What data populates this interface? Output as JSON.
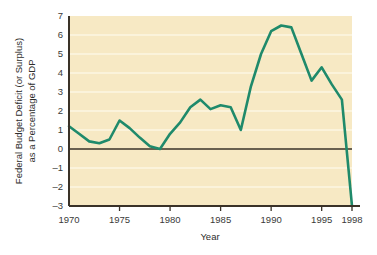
{
  "chart_data": {
    "type": "line",
    "title": "",
    "xlabel": "Year",
    "ylabel": "Federal Budget Deficit (or Surplus) as a Percentage of GDP",
    "ylabel_line1": "Federal Budget Deficit (or Surplus)",
    "ylabel_line2": "as a Percentage of GDP",
    "xlim": [
      1970,
      1998
    ],
    "ylim": [
      -3,
      7
    ],
    "grid": "horizontal",
    "legend": "none",
    "line_color": "#1f8a6b",
    "plot_background": "#f7e9c4",
    "gridline_color": "#fdf6e3",
    "axis_color": "#3a3228",
    "zero_line_color": "#3a3228",
    "xticks": [
      1970,
      1975,
      1980,
      1985,
      1990,
      1995,
      1998
    ],
    "xtick_labels": [
      "1970",
      "1975",
      "1980",
      "1985",
      "1990",
      "1995",
      "1998"
    ],
    "yticks": [
      7,
      6,
      5,
      4,
      3,
      2,
      1,
      0,
      -1,
      -2,
      -3
    ],
    "ytick_labels": [
      "7",
      "6",
      "5",
      "4",
      "3",
      "2",
      "1",
      "0",
      "–1",
      "–2",
      "–3"
    ],
    "x": [
      1970,
      1971,
      1972,
      1973,
      1974,
      1975,
      1976,
      1977,
      1978,
      1979,
      1980,
      1981,
      1982,
      1983,
      1984,
      1985,
      1986,
      1987,
      1988,
      1989,
      1990,
      1991,
      1992,
      1993,
      1994,
      1995,
      1996,
      1997,
      1998
    ],
    "values": [
      1.2,
      0.8,
      0.4,
      0.3,
      0.5,
      1.5,
      1.1,
      0.6,
      0.15,
      0.0,
      0.8,
      1.4,
      2.2,
      2.6,
      2.1,
      2.3,
      2.2,
      1.0,
      3.3,
      5.0,
      6.2,
      6.5,
      6.4,
      5.0,
      3.6,
      4.3,
      3.4,
      2.6,
      -3.0
    ],
    "series": [
      {
        "name": "Federal Budget Deficit (or Surplus) as a Percentage of GDP",
        "color": "#1f8a6b",
        "values": [
          1.2,
          0.8,
          0.4,
          0.3,
          0.5,
          1.5,
          1.1,
          0.6,
          0.15,
          0.0,
          0.8,
          1.4,
          2.2,
          2.6,
          2.1,
          2.3,
          2.2,
          1.0,
          3.3,
          5.0,
          6.2,
          6.5,
          6.4,
          5.0,
          3.6,
          4.3,
          3.4,
          2.6,
          -3.0
        ]
      }
    ]
  }
}
